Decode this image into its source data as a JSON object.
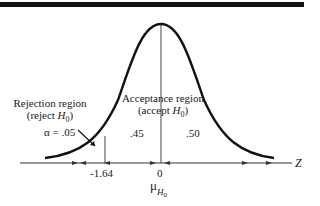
{
  "diagram": {
    "type": "normal-distribution-hypothesis-test",
    "rejection_region": {
      "title": "Rejection region",
      "subtitle_prefix": "(reject ",
      "subtitle_var": "H",
      "subtitle_sub": "0",
      "subtitle_suffix": ")",
      "alpha_label": "α = .05"
    },
    "acceptance_region": {
      "title": "Acceptance region",
      "subtitle_prefix": "(accept ",
      "subtitle_var": "H",
      "subtitle_sub": "0",
      "subtitle_suffix": ")",
      "left_area": ".45",
      "right_area": ".50"
    },
    "axis": {
      "label": "Z",
      "ticks": [
        "-1.64",
        "0"
      ],
      "mean_symbol": "μ",
      "mean_sub_var": "H",
      "mean_sub_sub": "0"
    },
    "colors": {
      "curve": "#111111",
      "axis": "#333333",
      "bar": "#111111"
    }
  }
}
